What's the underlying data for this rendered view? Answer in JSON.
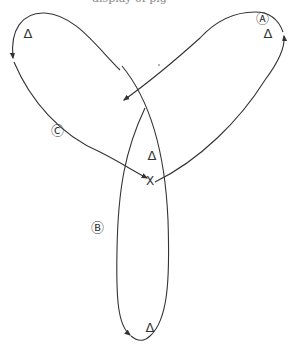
{
  "top_fragment": "display of pig",
  "labels": {
    "loop_a": "Ⓐ",
    "loop_b": "Ⓑ",
    "loop_c": "Ⓒ",
    "crossing": "X",
    "triangle": "Δ"
  },
  "triangles": [
    {
      "id": "c",
      "x": 28,
      "y": 38
    },
    {
      "id": "a",
      "x": 268,
      "y": 38
    },
    {
      "id": "center",
      "x": 152,
      "y": 160
    },
    {
      "id": "b",
      "x": 150,
      "y": 332
    }
  ],
  "colors": {
    "stroke": "#333333",
    "background": "#ffffff"
  }
}
